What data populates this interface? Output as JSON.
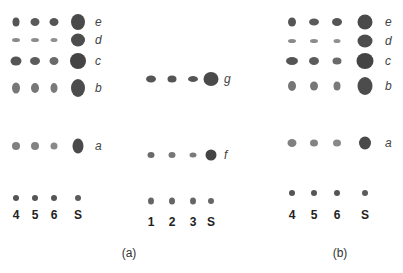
{
  "figure": {
    "panels": [
      {
        "id": "a-left",
        "lanes": [
          "4",
          "5",
          "6",
          "S"
        ],
        "lane_x": [
          16,
          35,
          54,
          78
        ],
        "label_x": 95,
        "rows": [
          {
            "name": "e",
            "y": 22,
            "spots": [
              [
                7,
                9,
                "#555"
              ],
              [
                9,
                8,
                "#5a5a5a"
              ],
              [
                9,
                8,
                "#555"
              ],
              [
                14,
                16,
                "#4a4a4a"
              ]
            ]
          },
          {
            "name": "d",
            "y": 40,
            "spots": [
              [
                8,
                4,
                "#8a8a8a"
              ],
              [
                8,
                4,
                "#8c8c8c"
              ],
              [
                7,
                4,
                "#909090"
              ],
              [
                14,
                13,
                "#4d4d4d"
              ]
            ]
          },
          {
            "name": "c",
            "y": 61,
            "spots": [
              [
                11,
                9,
                "#555"
              ],
              [
                10,
                8,
                "#5c5c5c"
              ],
              [
                9,
                8,
                "#6a6a6a"
              ],
              [
                16,
                16,
                "#444"
              ]
            ]
          },
          {
            "name": "b",
            "y": 88,
            "spots": [
              [
                8,
                11,
                "#777"
              ],
              [
                8,
                10,
                "#777"
              ],
              [
                7,
                10,
                "#7a7a7a"
              ],
              [
                14,
                18,
                "#4c4c4c"
              ]
            ]
          },
          {
            "name": "a",
            "y": 146,
            "spots": [
              [
                8,
                8,
                "#808080"
              ],
              [
                8,
                8,
                "#828282"
              ],
              [
                7,
                7,
                "#888"
              ],
              [
                11,
                15,
                "#4a4a4a"
              ]
            ]
          },
          {
            "name": "",
            "y": 198,
            "spots": [
              [
                6,
                6,
                "#555"
              ],
              [
                6,
                6,
                "#555"
              ],
              [
                6,
                6,
                "#555"
              ],
              [
                6,
                6,
                "#5c5c5c"
              ]
            ]
          }
        ],
        "lane_label_y": 215
      },
      {
        "id": "a-center",
        "lanes": [
          "1",
          "2",
          "3",
          "S"
        ],
        "lane_x": [
          151,
          172,
          193,
          211
        ],
        "label_x": 224,
        "rows": [
          {
            "name": "g",
            "y": 79,
            "spots": [
              [
                10,
                7,
                "#555"
              ],
              [
                9,
                7,
                "#555"
              ],
              [
                10,
                6,
                "#555"
              ],
              [
                15,
                14,
                "#4a4a4a"
              ]
            ]
          },
          {
            "name": "f",
            "y": 155,
            "spots": [
              [
                7,
                6,
                "#6a6a6a"
              ],
              [
                7,
                6,
                "#777"
              ],
              [
                7,
                5,
                "#7a7a7a"
              ],
              [
                11,
                11,
                "#444"
              ]
            ]
          },
          {
            "name": "",
            "y": 201,
            "spots": [
              [
                6,
                7,
                "#666"
              ],
              [
                6,
                7,
                "#666"
              ],
              [
                6,
                7,
                "#666"
              ],
              [
                6,
                6,
                "#666"
              ]
            ]
          }
        ],
        "lane_label_y": 222
      },
      {
        "id": "b",
        "lanes": [
          "4",
          "5",
          "6",
          "S"
        ],
        "lane_x": [
          292,
          314,
          337,
          365
        ],
        "label_x": 385,
        "rows": [
          {
            "name": "e",
            "y": 22,
            "spots": [
              [
                8,
                9,
                "#555"
              ],
              [
                10,
                7,
                "#5a5a5a"
              ],
              [
                10,
                8,
                "#555"
              ],
              [
                15,
                15,
                "#4a4a4a"
              ]
            ]
          },
          {
            "name": "d",
            "y": 41,
            "spots": [
              [
                8,
                4,
                "#8a8a8a"
              ],
              [
                8,
                4,
                "#8c8c8c"
              ],
              [
                7,
                4,
                "#909090"
              ],
              [
                15,
                13,
                "#4d4d4d"
              ]
            ]
          },
          {
            "name": "c",
            "y": 61,
            "spots": [
              [
                12,
                8,
                "#555"
              ],
              [
                10,
                8,
                "#5c5c5c"
              ],
              [
                9,
                7,
                "#6a6a6a"
              ],
              [
                17,
                16,
                "#444"
              ]
            ]
          },
          {
            "name": "b",
            "y": 86,
            "spots": [
              [
                8,
                10,
                "#777"
              ],
              [
                8,
                9,
                "#777"
              ],
              [
                7,
                9,
                "#7a7a7a"
              ],
              [
                15,
                18,
                "#4c4c4c"
              ]
            ]
          },
          {
            "name": "a",
            "y": 143,
            "spots": [
              [
                9,
                8,
                "#808080"
              ],
              [
                8,
                7,
                "#828282"
              ],
              [
                8,
                7,
                "#888"
              ],
              [
                12,
                13,
                "#4a4a4a"
              ]
            ]
          },
          {
            "name": "",
            "y": 193,
            "spots": [
              [
                6,
                6,
                "#555"
              ],
              [
                6,
                6,
                "#555"
              ],
              [
                6,
                6,
                "#555"
              ],
              [
                6,
                6,
                "#5c5c5c"
              ]
            ]
          }
        ],
        "lane_label_y": 215
      }
    ],
    "panel_captions": [
      {
        "text": "(a)",
        "x": 129,
        "y": 253
      },
      {
        "text": "(b)",
        "x": 340,
        "y": 253
      }
    ]
  }
}
